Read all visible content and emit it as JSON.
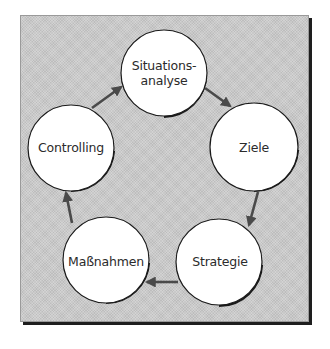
{
  "diagram": {
    "type": "cycle",
    "background_color": "#c9c9c9",
    "arrow_color": "#4a4a4a",
    "nodes": [
      {
        "id": "situationsanalyse",
        "lines": [
          "Situations-",
          "analyse"
        ]
      },
      {
        "id": "ziele",
        "lines": [
          "Ziele"
        ]
      },
      {
        "id": "strategie",
        "lines": [
          "Strategie"
        ]
      },
      {
        "id": "massnahmen",
        "lines": [
          "Maßnahmen"
        ]
      },
      {
        "id": "controlling",
        "lines": [
          "Controlling"
        ]
      }
    ],
    "edges": [
      {
        "from": "situationsanalyse",
        "to": "ziele"
      },
      {
        "from": "ziele",
        "to": "strategie"
      },
      {
        "from": "strategie",
        "to": "massnahmen"
      },
      {
        "from": "massnahmen",
        "to": "controlling"
      },
      {
        "from": "controlling",
        "to": "situationsanalyse"
      }
    ]
  }
}
